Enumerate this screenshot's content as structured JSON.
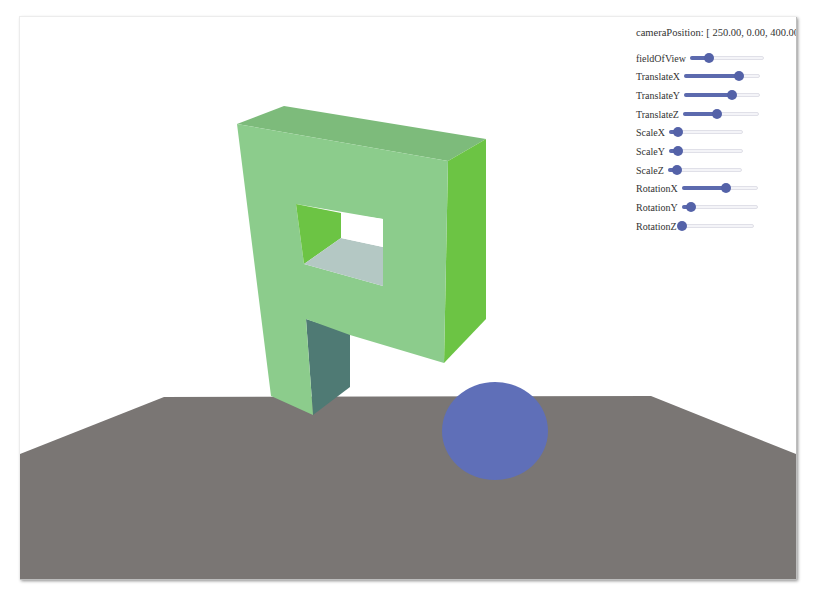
{
  "camera_position": {
    "label": "cameraPosition:",
    "value": "[ 250.00, 0.00, 400.00]",
    "display": "cameraPosition: [ 250.00, 0.00, 400.00]"
  },
  "controls": [
    {
      "id": "fieldOfView",
      "label": "fieldOfView",
      "value_pct": 26
    },
    {
      "id": "TranslateX",
      "label": "TranslateX",
      "value_pct": 72
    },
    {
      "id": "TranslateY",
      "label": "TranslateY",
      "value_pct": 63
    },
    {
      "id": "TranslateZ",
      "label": "TranslateZ",
      "value_pct": 45
    },
    {
      "id": "ScaleX",
      "label": "ScaleX",
      "value_pct": 12
    },
    {
      "id": "ScaleY",
      "label": "ScaleY",
      "value_pct": 12
    },
    {
      "id": "ScaleZ",
      "label": "ScaleZ",
      "value_pct": 12
    },
    {
      "id": "RotationX",
      "label": "RotationX",
      "value_pct": 58
    },
    {
      "id": "RotationY",
      "label": "RotationY",
      "value_pct": 12
    },
    {
      "id": "RotationZ",
      "label": "RotationZ",
      "value_pct": 2
    }
  ],
  "scene": {
    "colors": {
      "ground": "#7a7674",
      "letter_front": "#8ccc8c",
      "letter_top": "#7dbb7b",
      "letter_side_bright": "#6cc444",
      "letter_inner_bottom": "#b4c8c4",
      "letter_leg_shadow": "#4f7a74",
      "sphere": "#5f6fb8",
      "slider_accent": "#5462a8"
    },
    "objects": [
      "letter-P",
      "sphere",
      "ground-plane"
    ]
  }
}
